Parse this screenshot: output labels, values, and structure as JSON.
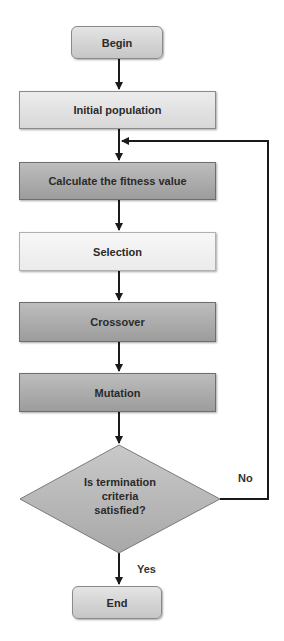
{
  "diagram": {
    "type": "flowchart",
    "nodes": {
      "begin": "Begin",
      "initial_population": "Initial population",
      "fitness": "Calculate the fitness value",
      "selection": "Selection",
      "crossover": "Crossover",
      "mutation": "Mutation",
      "decision_line1": "Is termination",
      "decision_line2": "criteria",
      "decision_line3": "satisfied?",
      "end": "End"
    },
    "edge_labels": {
      "no": "No",
      "yes": "Yes"
    },
    "edges": [
      {
        "from": "Begin",
        "to": "Initial population"
      },
      {
        "from": "Initial population",
        "to": "Calculate the fitness value"
      },
      {
        "from": "Calculate the fitness value",
        "to": "Selection"
      },
      {
        "from": "Selection",
        "to": "Crossover"
      },
      {
        "from": "Crossover",
        "to": "Mutation"
      },
      {
        "from": "Mutation",
        "to": "Is termination criteria satisfied?"
      },
      {
        "from": "Is termination criteria satisfied?",
        "to": "Calculate the fitness value",
        "label": "No"
      },
      {
        "from": "Is termination criteria satisfied?",
        "to": "End",
        "label": "Yes"
      }
    ],
    "colors": {
      "line": "#1a1a1a",
      "box_mid": "#d4d4d4",
      "box_dark": "#acacac",
      "box_light": "#f2f2f2",
      "diamond": "#b8b8b8"
    }
  }
}
